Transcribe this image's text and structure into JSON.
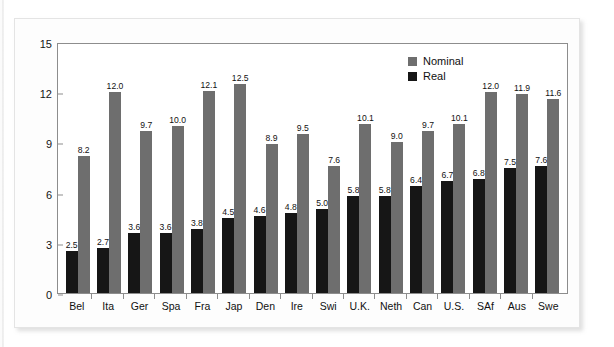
{
  "chart_data": {
    "type": "bar",
    "title": "",
    "xlabel": "",
    "ylabel": "Annualized Percentage Return",
    "ylim": [
      0,
      15
    ],
    "yticks": [
      0,
      3,
      6,
      9,
      12,
      15
    ],
    "grid": false,
    "legend_position": "top-right",
    "categories": [
      "Bel",
      "Ita",
      "Ger",
      "Spa",
      "Fra",
      "Jap",
      "Den",
      "Ire",
      "Swi",
      "U.K.",
      "Neth",
      "Can",
      "U.S.",
      "SAf",
      "Aus",
      "Swe"
    ],
    "series": [
      {
        "name": "Real",
        "color": "#161616",
        "values": [
          2.5,
          2.7,
          3.6,
          3.6,
          3.8,
          4.5,
          4.6,
          4.8,
          5.0,
          5.8,
          5.8,
          6.4,
          6.7,
          6.8,
          7.5,
          7.6
        ],
        "labels": [
          "2.5",
          "2.7",
          "3.6",
          "3.6",
          "3.8",
          "4.5",
          "4.6",
          "4.8",
          "5.0",
          "5.8",
          "5.8",
          "6.4",
          "6.7",
          "6.8",
          "7.5",
          "7.6"
        ]
      },
      {
        "name": "Nominal",
        "color": "#6e6e6e",
        "values": [
          8.2,
          12.0,
          9.7,
          10.0,
          12.1,
          12.5,
          8.9,
          9.5,
          7.6,
          10.1,
          9.0,
          9.7,
          10.1,
          12.0,
          11.9,
          11.6
        ],
        "labels": [
          "8.2",
          "12.0",
          "9.7",
          "10.0",
          "12.1",
          "12.5",
          "8.9",
          "9.5",
          "7.6",
          "10.1",
          "9.0",
          "9.7",
          "10.1",
          "12.0",
          "11.9",
          "11.6"
        ]
      }
    ]
  },
  "legend": {
    "entries": [
      {
        "label": "Nominal",
        "color": "#6e6e6e"
      },
      {
        "label": "Real",
        "color": "#161616"
      }
    ]
  },
  "axis": {
    "y_title": "Annualized Percentage Return",
    "y_tick_labels": [
      "15",
      "12",
      "9",
      "6",
      "3",
      "0"
    ]
  }
}
